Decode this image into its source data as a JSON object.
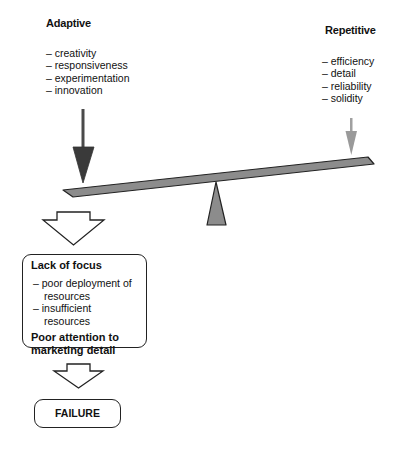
{
  "adaptive": {
    "title": "Adaptive",
    "items": [
      "creativity",
      "responsiveness",
      "experimentation",
      "innovation"
    ]
  },
  "repetitive": {
    "title": "Repetitive",
    "items": [
      "efficiency",
      "detail",
      "reliability",
      "solidity"
    ]
  },
  "outcome_box": {
    "title": "Lack of focus",
    "items": [
      "poor deployment of resources",
      "insufficient resources"
    ],
    "footer_line1": "Poor attention to",
    "footer_line2": "marketing detail"
  },
  "result_box": {
    "label": "FAILURE"
  },
  "colors": {
    "adaptive_arrow": "#3a3a3a",
    "repetitive_arrow": "#9a9a9a",
    "beam_fill": "#8c8c8c",
    "outline": "#222222"
  }
}
